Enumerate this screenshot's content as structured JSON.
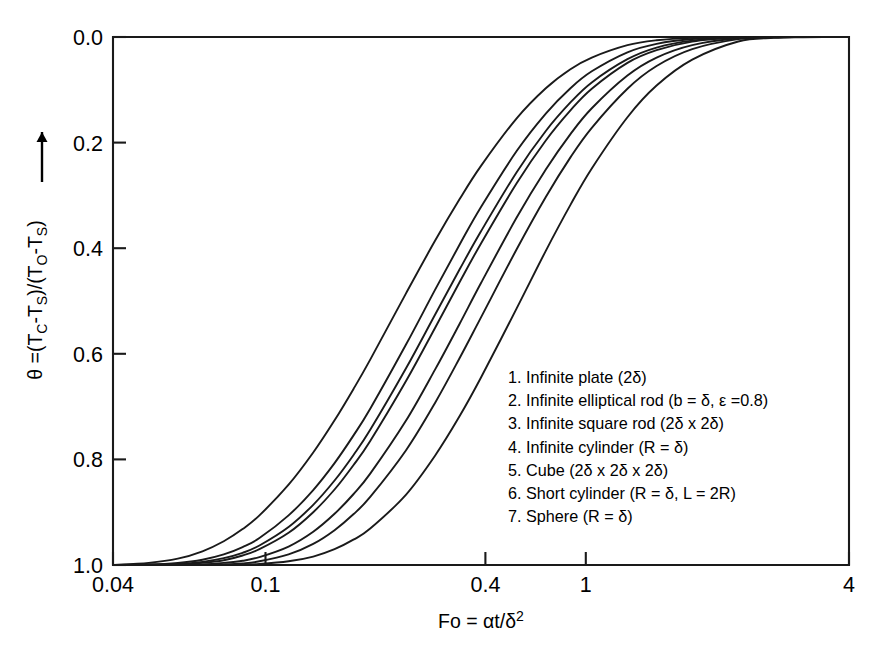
{
  "chart_data": {
    "type": "line",
    "title": "",
    "xlabel": "Fo = αt/δ²",
    "ylabel": "θ =(T_C-T_S)/(T_O-T_S)",
    "xscale": "log",
    "xlim": [
      0.04,
      4
    ],
    "ylim": [
      1.0,
      0.0
    ],
    "y_inverted": true,
    "grid": false,
    "legend_position": "inside-lower-right",
    "xticks": [
      0.04,
      0.1,
      0.4,
      1,
      4
    ],
    "xtick_labels": [
      "0.04",
      "0.1",
      "0.4",
      "1",
      "4"
    ],
    "yticks": [
      0.0,
      0.2,
      0.4,
      0.6,
      0.8,
      1.0
    ],
    "ytick_labels": [
      "0.0",
      "0.2",
      "0.4",
      "0.6",
      "0.8",
      "1.0"
    ],
    "x": [
      0.04,
      0.05,
      0.06,
      0.07,
      0.08,
      0.09,
      0.1,
      0.12,
      0.14,
      0.16,
      0.18,
      0.2,
      0.25,
      0.3,
      0.35,
      0.4,
      0.5,
      0.6,
      0.7,
      0.8,
      1.0,
      1.2,
      1.5,
      2.0,
      2.5,
      3.0,
      4.0
    ],
    "series": [
      {
        "name": "Infinite plate (2δ)",
        "index": 1,
        "theta_half": 0.196,
        "values": [
          1.0,
          0.996,
          0.988,
          0.974,
          0.955,
          0.932,
          0.906,
          0.848,
          0.787,
          0.726,
          0.667,
          0.611,
          0.486,
          0.386,
          0.307,
          0.244,
          0.154,
          0.097,
          0.061,
          0.039,
          0.0155,
          0.0062,
          0.0016,
          0.00012,
          1e-05,
          0.0,
          0.0
        ]
      },
      {
        "name": "Infinite elliptical rod (b = δ, ε =0.8)",
        "index": 2,
        "theta_half": 0.258,
        "values": [
          1.0,
          0.999,
          0.996,
          0.99,
          0.98,
          0.966,
          0.949,
          0.906,
          0.858,
          0.807,
          0.755,
          0.704,
          0.583,
          0.479,
          0.393,
          0.322,
          0.216,
          0.145,
          0.097,
          0.065,
          0.029,
          0.013,
          0.0039,
          0.00042,
          5e-05,
          0.0,
          0.0
        ]
      },
      {
        "name": "Infinite square rod (2δ x 2δ)",
        "index": 3,
        "theta_half": 0.292,
        "values": [
          1.0,
          0.999,
          0.998,
          0.994,
          0.987,
          0.977,
          0.963,
          0.928,
          0.886,
          0.84,
          0.792,
          0.744,
          0.628,
          0.526,
          0.44,
          0.368,
          0.256,
          0.178,
          0.124,
          0.086,
          0.042,
          0.02,
          0.0068,
          0.00088,
          0.00011,
          1e-05,
          0.0
        ]
      },
      {
        "name": "Infinite cylinder (R = δ)",
        "index": 4,
        "theta_half": 0.305,
        "values": [
          1.0,
          1.0,
          0.999,
          0.996,
          0.991,
          0.982,
          0.97,
          0.939,
          0.9,
          0.857,
          0.811,
          0.765,
          0.652,
          0.551,
          0.464,
          0.391,
          0.277,
          0.196,
          0.139,
          0.098,
          0.049,
          0.025,
          0.0087,
          0.0012,
          0.00017,
          2e-05,
          0.0
        ]
      },
      {
        "name": "Cube (2δ x 2δ x 2δ)",
        "index": 5,
        "theta_half": 0.352,
        "values": [
          1.0,
          1.0,
          1.0,
          0.999,
          0.996,
          0.992,
          0.985,
          0.965,
          0.937,
          0.903,
          0.866,
          0.827,
          0.727,
          0.63,
          0.543,
          0.466,
          0.342,
          0.251,
          0.184,
          0.135,
          0.073,
          0.039,
          0.0153,
          0.0024,
          0.00038,
          6e-05,
          0.0
        ]
      },
      {
        "name": "Short cylinder (R = δ, L = 2R)",
        "index": 6,
        "theta_half": 0.404,
        "values": [
          1.0,
          1.0,
          1.0,
          1.0,
          0.999,
          0.997,
          0.993,
          0.98,
          0.96,
          0.934,
          0.904,
          0.871,
          0.783,
          0.693,
          0.608,
          0.531,
          0.402,
          0.303,
          0.228,
          0.172,
          0.098,
          0.055,
          0.023,
          0.0041,
          0.00072,
          0.00013,
          0.0
        ]
      },
      {
        "name": "Sphere (R = δ)",
        "index": 7,
        "theta_half": 0.512,
        "values": [
          1.0,
          1.0,
          1.0,
          1.0,
          1.0,
          0.999,
          0.998,
          0.993,
          0.984,
          0.97,
          0.952,
          0.931,
          0.867,
          0.793,
          0.718,
          0.645,
          0.514,
          0.405,
          0.318,
          0.249,
          0.152,
          0.092,
          0.043,
          0.0086,
          0.0017,
          0.00034,
          1e-05
        ]
      }
    ],
    "legend_entries": [
      "1. Infinite plate (2δ)",
      "2. Infinite elliptical rod (b = δ, ε =0.8)",
      "3. Infinite square rod (2δ x 2δ)",
      "4. Infinite cylinder (R = δ)",
      "5. Cube (2δ x 2δ x 2δ)",
      "6. Short cylinder (R = δ, L = 2R)",
      "7. Sphere (R = δ)"
    ]
  },
  "axes": {
    "y_label_parts": {
      "theta": "θ =(T",
      "sub_c": "C",
      "mid": "-T",
      "sub_s1": "S",
      "close1": ")/(T",
      "sub_o": "O",
      "mid2": "-T",
      "sub_s2": "S",
      "close2": ")"
    },
    "x_label_parts": {
      "main": "Fo = αt/δ",
      "exponent": "2"
    }
  },
  "colors": {
    "line": "#1a1a1a",
    "background": "#ffffff",
    "text": "#000000"
  }
}
